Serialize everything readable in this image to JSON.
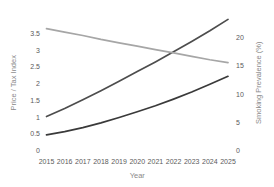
{
  "chart_data": {
    "type": "line",
    "title": "",
    "xlabel": "Year",
    "ylabel": "Price / Tax Index",
    "y2label": "Smoking Prevalence (%)",
    "grid": false,
    "legend": "none",
    "x": [
      2015,
      2016,
      2017,
      2018,
      2019,
      2020,
      2021,
      2022,
      2023,
      2024,
      2025
    ],
    "xtick_labels": [
      "2015",
      "2016",
      "2017",
      "2018",
      "2019",
      "2020",
      "2021",
      "2022",
      "2023",
      "2024",
      "2025"
    ],
    "ylim": [
      0,
      4.0
    ],
    "ytick_labels": [
      "0",
      "0.5",
      "1",
      "1.5",
      "2",
      "2.5",
      "3",
      "3.5"
    ],
    "ytick_values": [
      0,
      0.5,
      1,
      1.5,
      2,
      2.5,
      3,
      3.5
    ],
    "y2lim": [
      0,
      23.75
    ],
    "y2tick_labels": [
      "0",
      "5",
      "10",
      "15",
      "20"
    ],
    "y2tick_values": [
      0,
      5,
      10,
      15,
      20
    ],
    "series": [
      {
        "name": "Price Index",
        "axis": "left",
        "color": "#4d4d4d",
        "values": [
          1.0,
          1.24,
          1.5,
          1.77,
          2.05,
          2.34,
          2.63,
          2.93,
          3.24,
          3.56,
          3.9
        ]
      },
      {
        "name": "Tax Index",
        "axis": "left",
        "color": "#3a3a3a",
        "values": [
          0.45,
          0.55,
          0.67,
          0.81,
          0.97,
          1.14,
          1.32,
          1.52,
          1.73,
          1.96,
          2.2
        ]
      },
      {
        "name": "Smoking Prevalence",
        "axis": "right",
        "color": "#a6a6a6",
        "values": [
          21.5,
          20.9,
          20.3,
          19.6,
          19.0,
          18.4,
          17.8,
          17.2,
          16.6,
          16.0,
          15.5
        ]
      }
    ]
  },
  "colors": {
    "background": "#ffffff",
    "tick_text": "#5b5b5b",
    "axis_title_text": "#8a8a8a",
    "series_price": "#4d4d4d",
    "series_tax": "#3a3a3a",
    "series_prevalence": "#a6a6a6"
  }
}
